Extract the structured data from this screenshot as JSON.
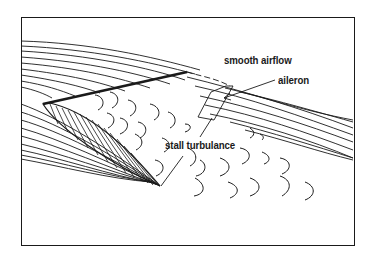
{
  "diagram": {
    "labels": {
      "smooth_airflow": "smooth airflow",
      "aileron": "aileron",
      "stall_turbulance": "stall turbulance"
    },
    "colors": {
      "ink": "#1a1a1a",
      "background": "#ffffff"
    }
  }
}
